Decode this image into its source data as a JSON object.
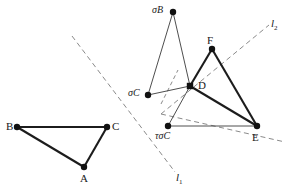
{
  "figure": {
    "caption": "",
    "background_color": "#ffffff",
    "solid_stroke_color": "#1c1c1c",
    "thin_stroke_color": "#3a3a3a",
    "dashed_stroke_color": "#8a8a8a",
    "point_color": "#111111",
    "label_color": "#1a1a1a",
    "width": 290,
    "height": 194
  },
  "points": [
    {
      "id": "B",
      "label": "B",
      "x": 17,
      "y": 127,
      "label_x": 6,
      "label_y": 121,
      "style": "plain"
    },
    {
      "id": "C",
      "label": "C",
      "x": 107,
      "y": 127,
      "label_x": 112,
      "label_y": 121,
      "style": "plain"
    },
    {
      "id": "A",
      "label": "A",
      "x": 84,
      "y": 167,
      "label_x": 80,
      "label_y": 173,
      "style": "plain"
    },
    {
      "id": "sB",
      "label": "σB",
      "x": 173,
      "y": 12,
      "label_x": 152,
      "label_y": 5,
      "style": "sigma"
    },
    {
      "id": "F",
      "label": "F",
      "x": 212,
      "y": 49,
      "label_x": 207,
      "label_y": 35,
      "style": "plain"
    },
    {
      "id": "sC",
      "label": "σC",
      "x": 148,
      "y": 95,
      "label_x": 128,
      "label_y": 88,
      "style": "sigma"
    },
    {
      "id": "D",
      "label": "D",
      "x": 190,
      "y": 86,
      "label_x": 198,
      "label_y": 80,
      "style": "square"
    },
    {
      "id": "tsC",
      "label": "τσC",
      "x": 168,
      "y": 126,
      "label_x": 155,
      "label_y": 131,
      "style": "sigma"
    },
    {
      "id": "E",
      "label": "E",
      "x": 257,
      "y": 126,
      "label_x": 252,
      "label_y": 132,
      "style": "plain"
    }
  ],
  "segments": [
    {
      "from": "B",
      "to": "C",
      "weight": "heavy"
    },
    {
      "from": "B",
      "to": "A",
      "weight": "heavy"
    },
    {
      "from": "A",
      "to": "C",
      "weight": "heavy"
    },
    {
      "from": "F",
      "to": "D",
      "weight": "heavy"
    },
    {
      "from": "F",
      "to": "E",
      "weight": "heavy"
    },
    {
      "from": "D",
      "to": "E",
      "weight": "heavy"
    },
    {
      "from": "sB",
      "to": "sC",
      "weight": "thin"
    },
    {
      "from": "sB",
      "to": "D",
      "weight": "thin"
    },
    {
      "from": "sC",
      "to": "D",
      "weight": "thin"
    },
    {
      "from": "tsC",
      "to": "D",
      "weight": "thin"
    },
    {
      "from": "tsC",
      "to": "E",
      "weight": "thin"
    }
  ],
  "dashed_lines": [
    {
      "id": "l1",
      "label": "l",
      "subscript": "1",
      "x1": 72,
      "y1": 36,
      "x2": 175,
      "y2": 172,
      "label_x": 176,
      "label_y": 172
    },
    {
      "id": "l2",
      "label": "l",
      "subscript": "2",
      "x1": 161,
      "y1": 114,
      "x2": 285,
      "y2": 142,
      "label_x": 271,
      "label_y": 18
    }
  ],
  "dashed_short_segment": {
    "id": "through-D",
    "x1": 161,
    "y1": 104,
    "x2": 178,
    "y2": 70
  },
  "dashed_l2_ray": {
    "id": "l2-upper-right",
    "x1": 161,
    "y1": 114,
    "x2": 269,
    "y2": 25
  }
}
